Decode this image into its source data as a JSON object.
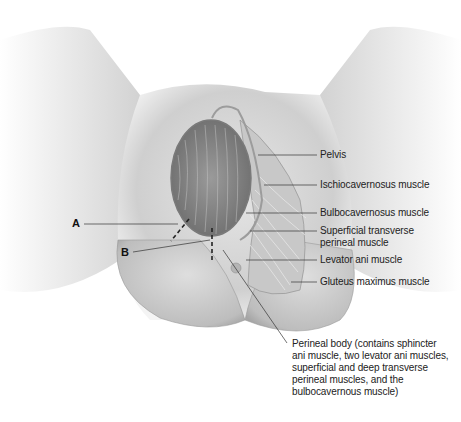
{
  "figure": {
    "colors": {
      "skin": "#d9d9d9",
      "skin_shadow": "#a8a8a8",
      "hair": "#8c8c8c",
      "muscle": "#c4c4c4",
      "line": "#333333"
    }
  },
  "labels": {
    "pelvis": "Pelvis",
    "ischiocavernosus": "Ischiocavernosus muscle",
    "bulbocavernosus": "Bulbocavernosus muscle",
    "superficial_transverse_1": "Superficial transverse",
    "superficial_transverse_2": "perineal muscle",
    "levator_ani": "Levator ani muscle",
    "gluteus_maximus": "Gluteus maximus muscle",
    "perineal_body": [
      "Perineal body (contains sphincter",
      "ani muscle, two levator ani muscles,",
      "superficial and deep transverse",
      "perineal muscles, and the",
      "bulbocavernous muscle)"
    ],
    "incision_a": "A",
    "incision_b": "B"
  }
}
